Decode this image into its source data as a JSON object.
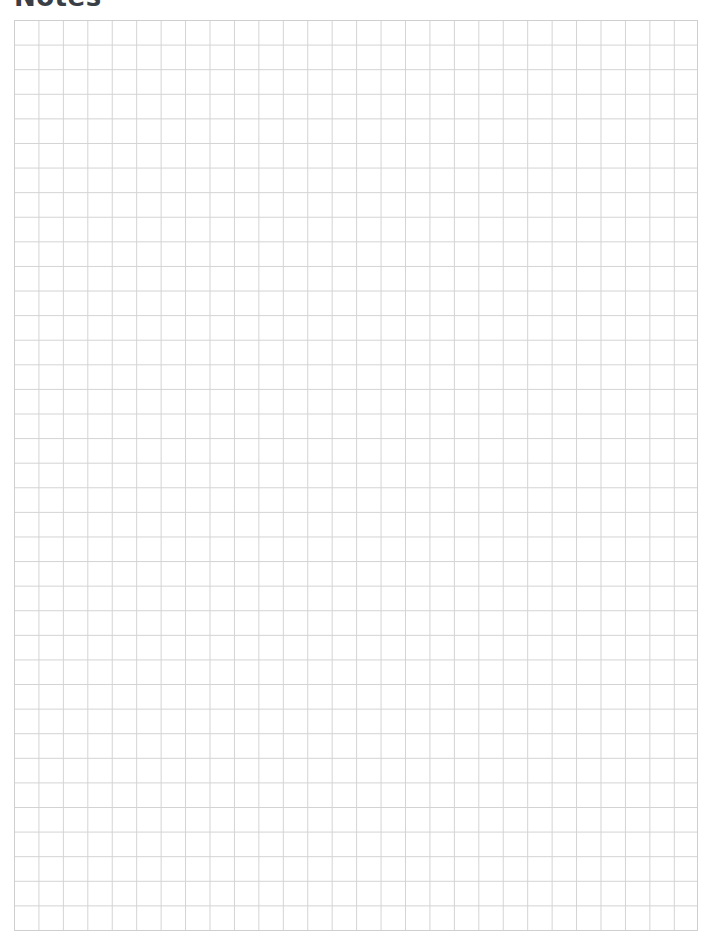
{
  "page": {
    "title": "Notes"
  },
  "grid": {
    "columns": 28,
    "rows": 37,
    "line_color": "#d3d3d3",
    "background_color": "#ffffff"
  }
}
